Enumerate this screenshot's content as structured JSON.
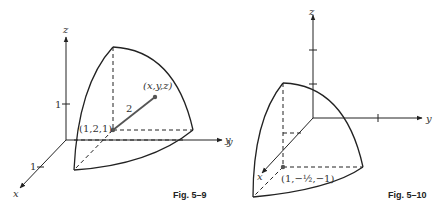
{
  "figures": [
    {
      "caption": "Fig. 5–9",
      "axes": {
        "x": "x",
        "y": "y",
        "z": "z"
      },
      "tick_labels": {
        "z_tick": "1",
        "x_tick": "1"
      },
      "center_label": "(1,2,1)",
      "point_label": "(x,y,z)",
      "radius_label": "2"
    },
    {
      "caption": "Fig. 5–10",
      "axes": {
        "x": "x",
        "y": "y",
        "z": "z"
      },
      "center_label": "(1,−½,−1)",
      "stray_label": "y"
    }
  ]
}
